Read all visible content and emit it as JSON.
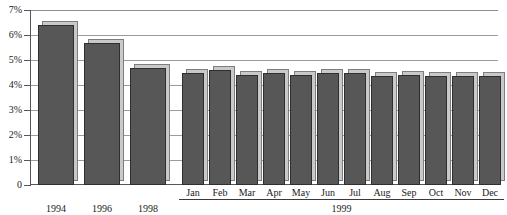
{
  "chart_data": {
    "type": "bar",
    "title": "",
    "subtitle": "",
    "xlabel": "",
    "ylabel": "",
    "ylim": [
      0,
      7
    ],
    "ytick_labels": [
      "7%",
      "6%",
      "5%",
      "4%",
      "3%",
      "2%",
      "1%",
      "0"
    ],
    "ytick_values": [
      7,
      6,
      5,
      4,
      3,
      2,
      1,
      0
    ],
    "grid": true,
    "legend": "none",
    "units": "percent",
    "categories": [
      "1994",
      "1996",
      "1998",
      "Jan",
      "Feb",
      "Mar",
      "Apr",
      "May",
      "Jun",
      "Jul",
      "Aug",
      "Sep",
      "Oct",
      "Nov",
      "Dec"
    ],
    "values": [
      6.4,
      5.7,
      4.7,
      4.5,
      4.6,
      4.4,
      4.5,
      4.4,
      4.5,
      4.5,
      4.35,
      4.4,
      4.35,
      4.35,
      4.35
    ],
    "series": [
      {
        "name": "Rate",
        "values": [
          6.4,
          5.7,
          4.7,
          4.5,
          4.6,
          4.4,
          4.5,
          4.4,
          4.5,
          4.5,
          4.35,
          4.4,
          4.35,
          4.35,
          4.35
        ]
      }
    ],
    "group_labels": [
      {
        "label": "1994",
        "members": [
          "1994"
        ]
      },
      {
        "label": "1996",
        "members": [
          "1996"
        ]
      },
      {
        "label": "1998",
        "members": [
          "1998"
        ]
      },
      {
        "label": "1999",
        "members": [
          "Jan",
          "Feb",
          "Mar",
          "Apr",
          "May",
          "Jun",
          "Jul",
          "Aug",
          "Sep",
          "Oct",
          "Nov",
          "Dec"
        ]
      }
    ],
    "colors": {
      "bar_fill": "#575757",
      "bar_outline": "#2f2f2f",
      "bar_shadow": "#c9c9c9",
      "gridline": "#9a9b9e",
      "axis": "#55565a",
      "background": "#ffffff",
      "text": "#1a1a1a"
    }
  },
  "axis": {
    "y_ticks": [
      {
        "label": "7%",
        "value": 7
      },
      {
        "label": "6%",
        "value": 6
      },
      {
        "label": "5%",
        "value": 5
      },
      {
        "label": "4%",
        "value": 4
      },
      {
        "label": "3%",
        "value": 3
      },
      {
        "label": "2%",
        "value": 2
      },
      {
        "label": "1%",
        "value": 1
      },
      {
        "label": "0",
        "value": 0
      }
    ],
    "x_year_labels": [
      "1994",
      "1996",
      "1998"
    ],
    "x_month_labels": [
      "Jan",
      "Feb",
      "Mar",
      "Apr",
      "May",
      "Jun",
      "Jul",
      "Aug",
      "Sep",
      "Oct",
      "Nov",
      "Dec"
    ],
    "x_group_label": "1999"
  }
}
